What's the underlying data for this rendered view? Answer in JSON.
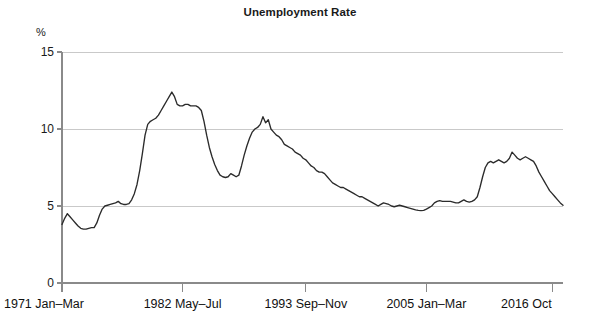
{
  "chart_data": {
    "type": "line",
    "title": "Unemployment Rate",
    "xlabel": "",
    "ylabel": "%",
    "ylim": [
      0,
      15
    ],
    "yticks": [
      0,
      5,
      10,
      15
    ],
    "ytick_labels": [
      "0",
      "5",
      "10",
      "15"
    ],
    "grid": true,
    "legend": "none",
    "xtick_labels": [
      "1971 Jan–Mar",
      "1982 May–Jul",
      "1993 Sep–Nov",
      "2005 Jan–Mar",
      "2016 Oct"
    ],
    "xtick_index": [
      0,
      45,
      91,
      136,
      183
    ],
    "x_start_label": "1971 Jan–Mar",
    "x_end_label": "2016 Oct",
    "series": [
      {
        "name": "Unemployment Rate",
        "color": "#2b2b2b",
        "values": [
          3.8,
          4.2,
          4.5,
          4.3,
          4.1,
          3.9,
          3.7,
          3.55,
          3.5,
          3.5,
          3.55,
          3.6,
          3.6,
          3.9,
          4.4,
          4.8,
          5.0,
          5.05,
          5.1,
          5.15,
          5.2,
          5.3,
          5.15,
          5.1,
          5.1,
          5.15,
          5.4,
          5.8,
          6.4,
          7.3,
          8.4,
          9.6,
          10.3,
          10.5,
          10.6,
          10.7,
          10.9,
          11.2,
          11.5,
          11.8,
          12.1,
          12.4,
          12.1,
          11.6,
          11.5,
          11.5,
          11.6,
          11.6,
          11.5,
          11.5,
          11.5,
          11.4,
          11.2,
          10.5,
          9.6,
          8.8,
          8.2,
          7.7,
          7.3,
          7.0,
          6.9,
          6.85,
          6.9,
          7.1,
          7.0,
          6.9,
          7.0,
          7.6,
          8.3,
          8.9,
          9.4,
          9.8,
          10.0,
          10.1,
          10.3,
          10.8,
          10.4,
          10.6,
          10.0,
          9.8,
          9.6,
          9.5,
          9.3,
          9.0,
          8.9,
          8.8,
          8.7,
          8.5,
          8.4,
          8.3,
          8.1,
          8.0,
          7.8,
          7.6,
          7.5,
          7.3,
          7.2,
          7.2,
          7.1,
          6.9,
          6.7,
          6.5,
          6.4,
          6.3,
          6.2,
          6.2,
          6.1,
          6.0,
          5.9,
          5.8,
          5.7,
          5.6,
          5.6,
          5.5,
          5.4,
          5.3,
          5.2,
          5.1,
          5.0,
          5.1,
          5.2,
          5.15,
          5.1,
          5.0,
          4.95,
          5.0,
          5.05,
          5.0,
          4.95,
          4.9,
          4.85,
          4.8,
          4.75,
          4.72,
          4.7,
          4.72,
          4.8,
          4.9,
          5.0,
          5.2,
          5.3,
          5.35,
          5.3,
          5.3,
          5.3,
          5.3,
          5.25,
          5.2,
          5.2,
          5.3,
          5.4,
          5.3,
          5.25,
          5.3,
          5.4,
          5.6,
          6.2,
          6.9,
          7.5,
          7.8,
          7.9,
          7.8,
          7.9,
          8.0,
          7.9,
          7.8,
          7.9,
          8.1,
          8.5,
          8.3,
          8.1,
          8.0,
          8.1,
          8.2,
          8.1,
          8.0,
          7.9,
          7.6,
          7.2,
          6.9,
          6.6,
          6.3,
          6.0,
          5.8,
          5.6,
          5.4,
          5.2,
          5.05
        ]
      }
    ],
    "annotations": []
  },
  "axis": {
    "unit_label": "%",
    "tick_color": "#8a8a8a",
    "grid_color": "#c9c9c9"
  },
  "colors": {
    "background": "#ffffff",
    "line": "#2b2b2b",
    "text": "#111111"
  }
}
